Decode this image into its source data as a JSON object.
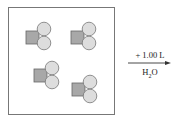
{
  "diagram": {
    "box": {
      "x": 8,
      "y": 7,
      "w": 106,
      "h": 107,
      "stroke": "#777777"
    },
    "molecules": [
      {
        "square": {
          "x": 26,
          "y": 31,
          "s": 13
        },
        "circles": [
          {
            "cx": 44,
            "cy": 29,
            "r": 6.8
          },
          {
            "cx": 44,
            "cy": 43,
            "r": 6.8
          }
        ]
      },
      {
        "square": {
          "x": 71,
          "y": 31,
          "s": 13
        },
        "circles": [
          {
            "cx": 89,
            "cy": 29,
            "r": 6.8
          },
          {
            "cx": 89,
            "cy": 43,
            "r": 6.8
          }
        ]
      },
      {
        "square": {
          "x": 34,
          "y": 69,
          "s": 13
        },
        "circles": [
          {
            "cx": 52,
            "cy": 68,
            "r": 6.8
          },
          {
            "cx": 52,
            "cy": 82,
            "r": 6.8
          }
        ]
      },
      {
        "square": {
          "x": 72,
          "y": 83,
          "s": 13
        },
        "circles": [
          {
            "cx": 90,
            "cy": 82,
            "r": 6.8
          },
          {
            "cx": 90,
            "cy": 96,
            "r": 6.8
          }
        ]
      }
    ],
    "colors": {
      "square_fill": "#a8a8a8",
      "square_stroke": "#666666",
      "circle_fill": "#dddddd",
      "circle_stroke": "#777777"
    },
    "arrow": {
      "x1": 128,
      "x2": 171,
      "y": 63
    },
    "label_above": "+ 1.00 L",
    "label_below_main": "H",
    "label_below_sub": "2",
    "label_below_end": "O"
  }
}
